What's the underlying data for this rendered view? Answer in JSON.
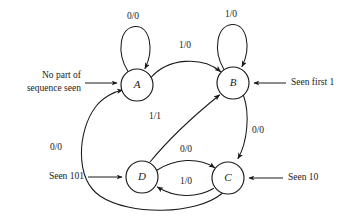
{
  "figure": {
    "kind": "state-transition-diagram",
    "stroke_color": "#1a1a1a",
    "background_color": "#ffffff"
  },
  "states": [
    {
      "id": "A",
      "label": "A",
      "cx": 137,
      "cy": 85,
      "r": 16
    },
    {
      "id": "B",
      "label": "B",
      "cx": 233,
      "cy": 83,
      "r": 16
    },
    {
      "id": "C",
      "label": "C",
      "cx": 228,
      "cy": 178,
      "r": 16
    },
    {
      "id": "D",
      "label": "D",
      "cx": 142,
      "cy": 177,
      "r": 16
    }
  ],
  "transitions": [
    {
      "id": "a-self",
      "from": "A",
      "to": "A",
      "label": "0/0",
      "lx": 133,
      "ly": 17
    },
    {
      "id": "b-self",
      "from": "B",
      "to": "B",
      "label": "1/0",
      "lx": 231,
      "ly": 15
    },
    {
      "id": "a-to-b",
      "from": "A",
      "to": "B",
      "label": "1/0",
      "lx": 185,
      "ly": 46
    },
    {
      "id": "b-to-c",
      "from": "B",
      "to": "C",
      "label": "0/0",
      "lx": 257,
      "ly": 131
    },
    {
      "id": "d-to-b",
      "from": "D",
      "to": "B",
      "label": "1/1",
      "lx": 155,
      "ly": 117
    },
    {
      "id": "d-to-c",
      "from": "D",
      "to": "C",
      "label": "0/0",
      "lx": 185,
      "ly": 151
    },
    {
      "id": "c-to-d",
      "from": "C",
      "to": "D",
      "label": "1/0",
      "lx": 185,
      "ly": 182
    },
    {
      "id": "c-to-a",
      "from": "C",
      "to": "A",
      "label": "0/0",
      "lx": 56,
      "ly": 148
    }
  ],
  "annotations": [
    {
      "id": "anno-a",
      "target": "A",
      "side": "left",
      "lines": [
        "No part of",
        "sequence seen"
      ],
      "line1": "No part of",
      "line2": "sequence seen"
    },
    {
      "id": "anno-b",
      "target": "B",
      "side": "right",
      "lines": [
        "Seen first 1"
      ],
      "line1": "Seen first 1",
      "line2": ""
    },
    {
      "id": "anno-d",
      "target": "D",
      "side": "left",
      "lines": [
        "Seen 101"
      ],
      "line1": "Seen 101",
      "line2": ""
    },
    {
      "id": "anno-c",
      "target": "C",
      "side": "right",
      "lines": [
        "Seen 10"
      ],
      "line1": "Seen 10",
      "line2": ""
    }
  ]
}
